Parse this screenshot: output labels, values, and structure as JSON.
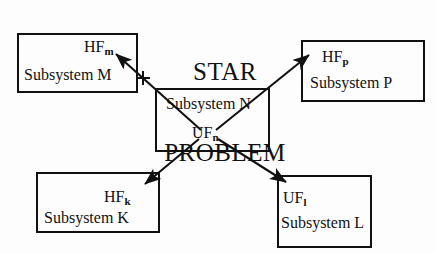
{
  "diagram": {
    "title_line1": "STAR",
    "title_line2": "PROBLEM",
    "stroke_color": "#111111",
    "background_color": "#fdfdfd"
  },
  "center_node": {
    "name": "Subsystem N",
    "flow_label": "UF",
    "flow_subscript": "n"
  },
  "nodes": [
    {
      "id": "m",
      "flow_label": "HF",
      "flow_subscript": "m",
      "name": "Subsystem M"
    },
    {
      "id": "p",
      "flow_label": "HF",
      "flow_subscript": "p",
      "name": "Subsystem P"
    },
    {
      "id": "k",
      "flow_label": "HF",
      "flow_subscript": "k",
      "name": "Subsystem K"
    },
    {
      "id": "l",
      "flow_label": "UF",
      "flow_subscript": "l",
      "name": "Subsystem L"
    }
  ],
  "arrows": [
    {
      "id": "n-to-m",
      "from": "center",
      "to": "m"
    },
    {
      "id": "n-to-p",
      "from": "center",
      "to": "p"
    },
    {
      "id": "n-to-k",
      "from": "center",
      "to": "k"
    },
    {
      "id": "n-to-l",
      "from": "center",
      "to": "l"
    }
  ],
  "marks": [
    {
      "id": "cross-mark",
      "symbol": "+"
    }
  ]
}
